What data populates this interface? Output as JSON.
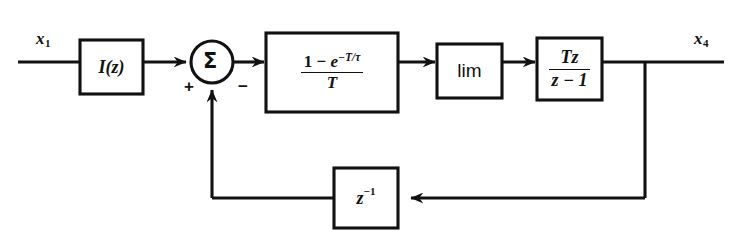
{
  "diagram": {
    "line_color": "#111111",
    "background": "#ffffff",
    "input_signal": "x",
    "input_subscript": "1",
    "output_signal": "x",
    "output_subscript": "4",
    "summing_junction": {
      "symbol": "Σ",
      "plus_sign": "+",
      "minus_sign": "−"
    },
    "blocks": {
      "input_gain": {
        "label": "I(z)",
        "i": "I",
        "open_paren": "(",
        "variable": "z",
        "close_paren": ")"
      },
      "hold": {
        "numerator_one": "1",
        "numerator_minus": "−",
        "numerator_exp_base": "e",
        "numerator_exp_sign": "−",
        "numerator_exp_T": "T",
        "numerator_exp_slash": "/",
        "numerator_exp_tau": "τ",
        "denominator": "T"
      },
      "limiter": {
        "label": "lim"
      },
      "integrator": {
        "numerator_T": "T",
        "numerator_z": "z",
        "denominator_z": "z",
        "denominator_minus": "−",
        "denominator_one": "1"
      },
      "delay": {
        "base": "z",
        "exponent": "−1"
      }
    }
  }
}
